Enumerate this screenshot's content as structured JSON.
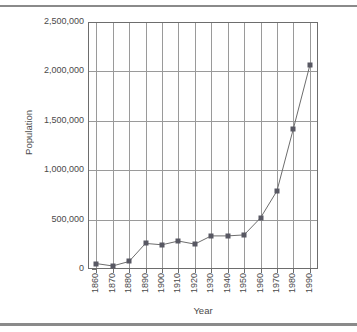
{
  "chart_data": {
    "type": "line",
    "title": "",
    "xlabel": "Year",
    "ylabel": "Population",
    "x": [
      1860,
      1870,
      1880,
      1890,
      1900,
      1910,
      1920,
      1930,
      1940,
      1950,
      1960,
      1970,
      1980,
      1990
    ],
    "xtick_labels": [
      "1860",
      "1870",
      "1880",
      "1890",
      "1900",
      "1910",
      "1920",
      "1930",
      "1940",
      "1950",
      "1960",
      "1970",
      "1980",
      "1990"
    ],
    "values": [
      55000,
      31000,
      76000,
      259000,
      245000,
      283000,
      252000,
      335000,
      335000,
      345000,
      517000,
      790000,
      1420000,
      2060000
    ],
    "ytick_labels": [
      "0",
      "500,000",
      "1,000,000",
      "1,500,000",
      "2,000,000",
      "2,500,000"
    ],
    "ytick_values": [
      0,
      500000,
      1000000,
      1500000,
      2000000,
      2500000
    ],
    "ylim": [
      0,
      2500000
    ],
    "xlim": [
      1855,
      1995
    ],
    "grid": true,
    "legend": false,
    "marker": "square",
    "series_color": "#585863",
    "line_color": "#6d6d6d",
    "grid_color": "#9a9a9a",
    "axis_color": "#6d6d6d",
    "text_color": "#4a4a4a"
  }
}
